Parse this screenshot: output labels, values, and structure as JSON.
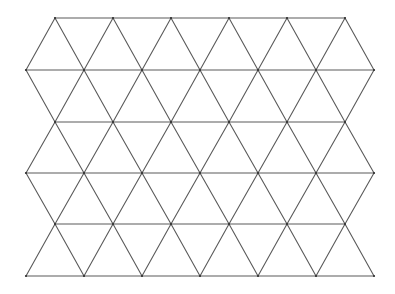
{
  "diagram": {
    "type": "triangular-lattice",
    "width": 395,
    "height": 294,
    "background": "#ffffff",
    "line_color": "#5a5a5a",
    "vertex_color": "#333333",
    "row_y": [
      18,
      70,
      122,
      173,
      224,
      276
    ],
    "even_row_x": [
      55,
      113,
      171,
      229,
      287,
      345
    ],
    "odd_row_x": [
      26,
      84,
      142,
      200,
      258,
      316,
      374
    ]
  }
}
